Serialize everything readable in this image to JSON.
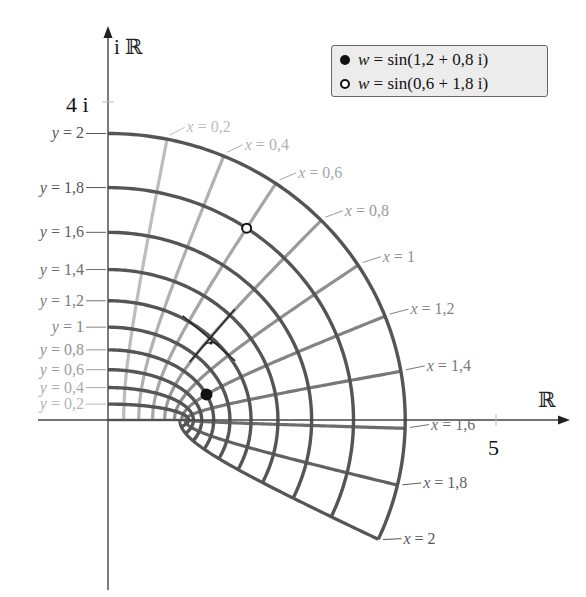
{
  "chart_data": {
    "type": "line",
    "title": "",
    "xlabel": "ℝ",
    "ylabel": "iℝ",
    "axis_ticks": [
      {
        "axis": "real",
        "value": 5,
        "label": "5"
      },
      {
        "axis": "imag",
        "value": 4,
        "label": "4 i"
      }
    ],
    "grid_on": false,
    "mapping": "sin",
    "x_lines": [
      {
        "x": 0.2,
        "label": "x = 0,2"
      },
      {
        "x": 0.4,
        "label": "x = 0,4"
      },
      {
        "x": 0.6,
        "label": "x = 0,6"
      },
      {
        "x": 0.8,
        "label": "x = 0,8"
      },
      {
        "x": 1.0,
        "label": "x = 1"
      },
      {
        "x": 1.2,
        "label": "x = 1,2"
      },
      {
        "x": 1.4,
        "label": "x = 1,4"
      },
      {
        "x": 1.6,
        "label": "x = 1,6"
      },
      {
        "x": 1.8,
        "label": "x = 1,8"
      },
      {
        "x": 2.0,
        "label": "x = 2"
      }
    ],
    "y_lines": [
      {
        "y": 0.2,
        "label": "y = 0,2"
      },
      {
        "y": 0.4,
        "label": "y = 0,4"
      },
      {
        "y": 0.6,
        "label": "y = 0,6"
      },
      {
        "y": 0.8,
        "label": "y = 0,8"
      },
      {
        "y": 1.0,
        "label": "y = 1"
      },
      {
        "y": 1.2,
        "label": "y = 1,2"
      },
      {
        "y": 1.4,
        "label": "y = 1,4"
      },
      {
        "y": 1.6,
        "label": "y = 1,6"
      },
      {
        "y": 1.8,
        "label": "y = 1,8"
      },
      {
        "y": 2.0,
        "label": "y = 2"
      }
    ],
    "x_range": [
      0,
      2
    ],
    "y_range": [
      0,
      2
    ],
    "points": [
      {
        "name": "w = sin(1,2 + 0,8 i)",
        "z": [
          1.2,
          0.8
        ],
        "w": [
          1.246,
          0.322
        ],
        "marker": "filled"
      },
      {
        "name": "w = sin(0,6 + 1,8 i)",
        "z": [
          0.6,
          1.8
        ],
        "w": [
          1.755,
          2.428
        ],
        "marker": "open"
      }
    ],
    "right_angle_marker": {
      "at_z": [
        0.8,
        1.2
      ],
      "w": [
        1.299,
        1.052
      ]
    },
    "legend_position": "top-right"
  },
  "legend": {
    "items": [
      {
        "marker": "filled",
        "prefix": "w",
        "text": " = sin(1,2 + 0,8 i)"
      },
      {
        "marker": "open",
        "prefix": "w",
        "text": " = sin(0,6 + 1,8 i)"
      }
    ]
  },
  "axes": {
    "real_label": "ℝ",
    "imag_label": "i ℝ",
    "real_tick_label": "5",
    "imag_tick_label": "4 i"
  },
  "colors": {
    "y_line": "#555555",
    "axis": "#444444",
    "x_line_light": "#bdbdbd",
    "x_line_dark": "#555555"
  }
}
